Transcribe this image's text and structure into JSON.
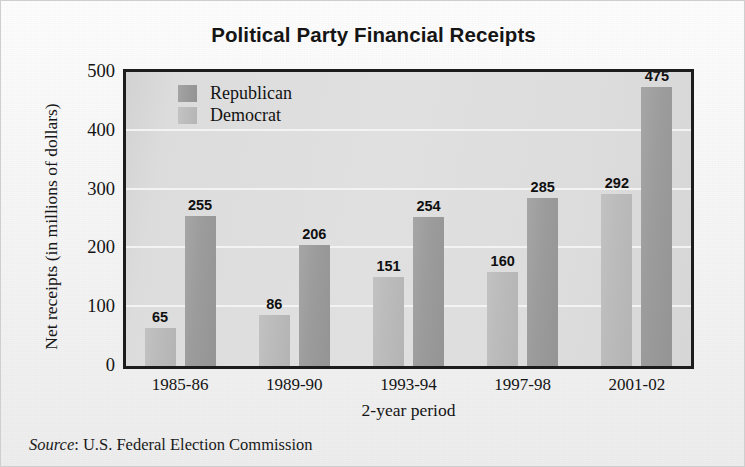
{
  "chart_data": {
    "type": "bar",
    "title": "Political Party Financial Receipts",
    "xlabel": "2-year period",
    "ylabel": "Net receipts (in millions of dollars)",
    "categories": [
      "1985-86",
      "1989-90",
      "1993-94",
      "1997-98",
      "2001-02"
    ],
    "series": [
      {
        "name": "Democrat",
        "color": "#bcbcbc",
        "values": [
          65,
          86,
          151,
          160,
          292
        ]
      },
      {
        "name": "Republican",
        "color": "#9a9a9a",
        "values": [
          255,
          206,
          254,
          285,
          475
        ]
      }
    ],
    "ylim": [
      0,
      500
    ],
    "yticks": [
      0,
      100,
      200,
      300,
      400,
      500
    ],
    "ytick_labels": [
      "0",
      "100",
      "200",
      "300",
      "400",
      "500"
    ],
    "gridlines": [
      100,
      200,
      300,
      400
    ],
    "grid": true,
    "grid_color": "#f3f3f3",
    "legend_position": "top-left-inside",
    "legend_entries": [
      "Republican",
      "Democrat"
    ],
    "plot_background": "#dcdcdc",
    "frame_color": "#1c1c1c",
    "data_labels": true
  },
  "source": {
    "prefix": "Source",
    "text": ": U.S. Federal Election Commission"
  }
}
